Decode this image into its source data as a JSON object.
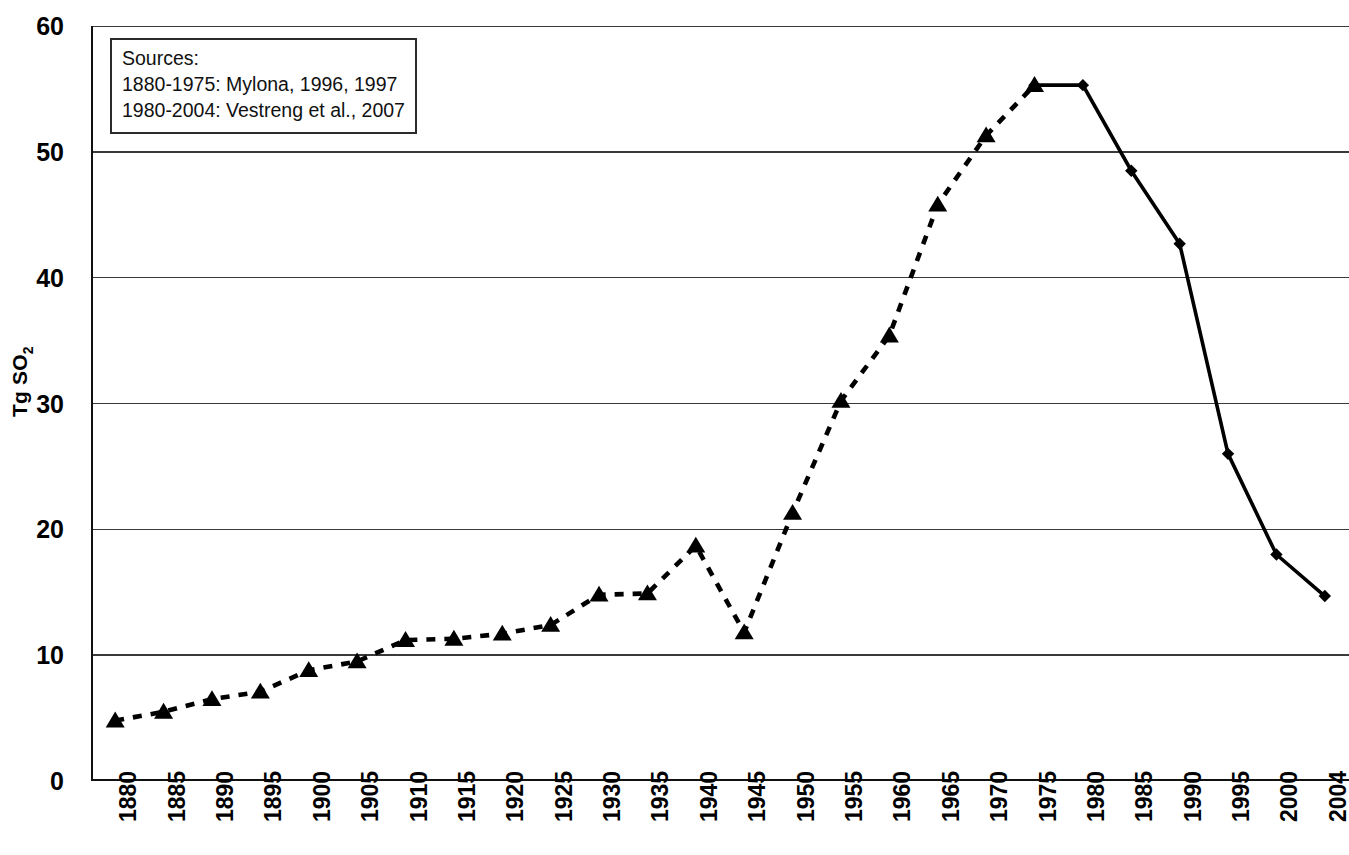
{
  "chart_data": {
    "type": "line",
    "title": "",
    "xlabel": "",
    "ylabel": "Tg SO2",
    "ylabel_html": "Tg SO<sub>2</sub>",
    "ylim": [
      0,
      60
    ],
    "ytick_values": [
      0,
      10,
      20,
      30,
      40,
      50,
      60
    ],
    "ytick_labels": [
      "0",
      "10",
      "20",
      "30",
      "40",
      "50",
      "60"
    ],
    "grid": true,
    "grid_axis": "y",
    "legend": "none",
    "categories": [
      "1880",
      "1885",
      "1890",
      "1895",
      "1900",
      "1905",
      "1910",
      "1915",
      "1920",
      "1925",
      "1930",
      "1935",
      "1940",
      "1945",
      "1950",
      "1955",
      "1960",
      "1965",
      "1970",
      "1975",
      "1980",
      "1985",
      "1990",
      "1995",
      "2000",
      "2004"
    ],
    "series": [
      {
        "name": "1880-1975: Mylona",
        "marker": "triangle",
        "line_style": "dashed",
        "color": "#000000",
        "x": [
          "1880",
          "1885",
          "1890",
          "1895",
          "1900",
          "1905",
          "1910",
          "1915",
          "1920",
          "1925",
          "1930",
          "1935",
          "1940",
          "1945",
          "1950",
          "1955",
          "1960",
          "1965",
          "1970",
          "1975"
        ],
        "values": [
          4.8,
          5.5,
          6.5,
          7.1,
          8.8,
          9.5,
          11.2,
          11.3,
          11.7,
          12.4,
          14.8,
          14.9,
          18.7,
          11.8,
          21.3,
          30.2,
          35.4,
          45.8,
          51.3,
          55.3
        ]
      },
      {
        "name": "1980-2004: Vestreng et al.",
        "marker": "diamond",
        "line_style": "solid",
        "color": "#000000",
        "x": [
          "1975",
          "1980",
          "1985",
          "1990",
          "1995",
          "2000",
          "2004"
        ],
        "values": [
          55.3,
          55.3,
          48.5,
          42.7,
          26.0,
          18.0,
          14.7
        ]
      }
    ],
    "annotations": {
      "sources_box": {
        "lines": [
          "Sources:",
          "1880-1975: Mylona, 1996, 1997",
          "1980-2004: Vestreng et al., 2007"
        ]
      }
    }
  },
  "sources": {
    "heading": "Sources:",
    "line1": "1880-1975: Mylona, 1996, 1997",
    "line2": "1980-2004: Vestreng et al., 2007"
  }
}
